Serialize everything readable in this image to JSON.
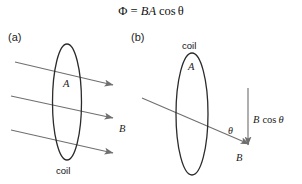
{
  "figure": {
    "title_formula": "Φ = BA cos θ",
    "formula_parts": {
      "phi": "Φ",
      "equals": "=",
      "b": "B",
      "a": "A",
      "cos": "cos",
      "theta": "θ"
    },
    "background_color": "#ffffff",
    "line_color": "#6f6f6f",
    "coil_color": "#2b2b2b",
    "text_color": "#111111"
  },
  "panel_a": {
    "label": "(a)",
    "coil_label": "coil",
    "area_label": "A",
    "field_label": "B",
    "field_line_count": 3
  },
  "panel_b": {
    "label": "(b)",
    "coil_label": "coil",
    "area_label": "A",
    "field_label": "B",
    "component_label_b": "B",
    "component_label_cos": "cos",
    "component_label_theta": "θ",
    "angle_label": "θ"
  }
}
